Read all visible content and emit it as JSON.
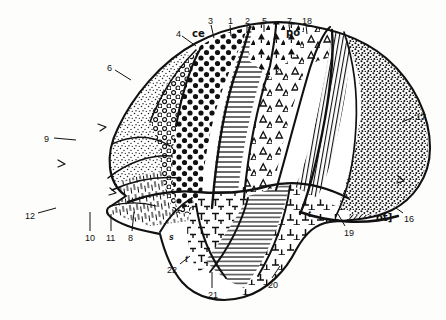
{
  "figure": {
    "kind": "cytoarchitectonic-brain-map",
    "view": "lateral hemisphere, anterior to the left",
    "background_color": "#fdfdfc",
    "ink_color": "#111111"
  },
  "labels": [
    {
      "id": "l4",
      "text": "4",
      "x": 176,
      "y": 30,
      "style": "num"
    },
    {
      "id": "lce",
      "text": "ce",
      "x": 192,
      "y": 29,
      "style": "text"
    },
    {
      "id": "l3",
      "text": "3",
      "x": 208,
      "y": 17,
      "style": "num"
    },
    {
      "id": "l1",
      "text": "1",
      "x": 228,
      "y": 17,
      "style": "num"
    },
    {
      "id": "l2",
      "text": "2",
      "x": 245,
      "y": 17,
      "style": "num"
    },
    {
      "id": "l5",
      "text": "5",
      "x": 262,
      "y": 17,
      "style": "num"
    },
    {
      "id": "l7",
      "text": "7",
      "x": 287,
      "y": 17,
      "style": "num"
    },
    {
      "id": "l18t",
      "text": "18",
      "x": 302,
      "y": 17,
      "style": "num"
    },
    {
      "id": "lpo",
      "text": "po",
      "x": 286,
      "y": 28,
      "style": "text"
    },
    {
      "id": "l6",
      "text": "6",
      "x": 107,
      "y": 64,
      "style": "num"
    },
    {
      "id": "l9",
      "text": "9",
      "x": 44,
      "y": 135,
      "style": "num"
    },
    {
      "id": "l12",
      "text": "12",
      "x": 25,
      "y": 212,
      "style": "num"
    },
    {
      "id": "l10",
      "text": "10",
      "x": 85,
      "y": 234,
      "style": "num"
    },
    {
      "id": "l11",
      "text": "11",
      "x": 106,
      "y": 234,
      "style": "num"
    },
    {
      "id": "l8",
      "text": "8",
      "x": 128,
      "y": 234,
      "style": "num"
    },
    {
      "id": "ls",
      "text": "s",
      "x": 169,
      "y": 233,
      "style": "ital"
    },
    {
      "id": "l22",
      "text": "22",
      "x": 167,
      "y": 266,
      "style": "num"
    },
    {
      "id": "l21",
      "text": "21",
      "x": 208,
      "y": 291,
      "style": "num"
    },
    {
      "id": "l20",
      "text": "20",
      "x": 268,
      "y": 281,
      "style": "num"
    },
    {
      "id": "l19",
      "text": "19",
      "x": 344,
      "y": 229,
      "style": "num"
    },
    {
      "id": "lot",
      "text": "ot]",
      "x": 376,
      "y": 213,
      "style": "text"
    },
    {
      "id": "l16",
      "text": "16",
      "x": 404,
      "y": 215,
      "style": "num"
    },
    {
      "id": "l17",
      "text": "17",
      "x": 416,
      "y": 113,
      "style": "num"
    },
    {
      "id": "lt1",
      "text": "t",
      "x": 308,
      "y": 210,
      "style": "ital"
    },
    {
      "id": "lt2",
      "text": "t",
      "x": 185,
      "y": 255,
      "style": "ital"
    }
  ],
  "regions": [
    {
      "id": "r4",
      "number": "4",
      "texture": "large-filled-dots",
      "name": "dense-coarse-stipple-field"
    },
    {
      "id": "r6",
      "number": "6",
      "texture": "open-rings",
      "name": "ring-stipple-field"
    },
    {
      "id": "r9",
      "number": "9",
      "texture": "fine-stipple",
      "name": "fine-stipple-frontal-pole"
    },
    {
      "id": "r12",
      "number": "12",
      "texture": "fine-stipple",
      "name": "orbital-field"
    },
    {
      "id": "r10",
      "number": "10",
      "texture": "short-dashes",
      "name": "dash-hatch-field"
    },
    {
      "id": "r11",
      "number": "11",
      "texture": "short-dashes",
      "name": "dash-hatch-field"
    },
    {
      "id": "r8",
      "number": "8",
      "texture": "short-dashes",
      "name": "dash-hatch-field"
    },
    {
      "id": "r3",
      "number": "3",
      "texture": "horizontal-lines",
      "name": "line-hatch-gyrus"
    },
    {
      "id": "r1",
      "number": "1",
      "texture": "horizontal-lines",
      "name": "line-hatch-gyrus"
    },
    {
      "id": "r2",
      "number": "2",
      "texture": "open-triangles",
      "name": "open-triangle-field"
    },
    {
      "id": "r5",
      "number": "5",
      "texture": "filled-triangles",
      "name": "filled-triangle-field"
    },
    {
      "id": "r7",
      "number": "7",
      "texture": "open-triangles",
      "name": "open-triangle-field"
    },
    {
      "id": "r18",
      "number": "18",
      "texture": "dense-vertical-hatch",
      "name": "dark-hatch-band"
    },
    {
      "id": "r17",
      "number": "17",
      "texture": "medium-stipple",
      "name": "occipital-stipple-field"
    },
    {
      "id": "r16",
      "number": "16",
      "texture": "dense-edge-hatch",
      "name": "occipital-margin-band"
    },
    {
      "id": "r19",
      "number": "19",
      "texture": "sparse-stipple",
      "name": "sparse-stipple-field"
    },
    {
      "id": "r20",
      "number": "20",
      "texture": "tee-marks",
      "name": "temporal-tee-field"
    },
    {
      "id": "r21",
      "number": "21",
      "texture": "horizontal-lines",
      "name": "temporal-line-field"
    },
    {
      "id": "r22",
      "number": "22",
      "texture": "tee-marks",
      "name": "superior-temporal-field"
    }
  ],
  "sulci": [
    {
      "id": "ce",
      "abbrev": "ce",
      "name": "central-sulcus-marker"
    },
    {
      "id": "po",
      "abbrev": "po",
      "name": "parieto-occipital-marker"
    },
    {
      "id": "ot",
      "abbrev": "ot]",
      "name": "occipitotemporal-marker"
    },
    {
      "id": "s",
      "abbrev": "s",
      "name": "sylvian-fissure-marker"
    },
    {
      "id": "t",
      "abbrev": "t",
      "name": "temporal-sulcus-marker"
    }
  ]
}
